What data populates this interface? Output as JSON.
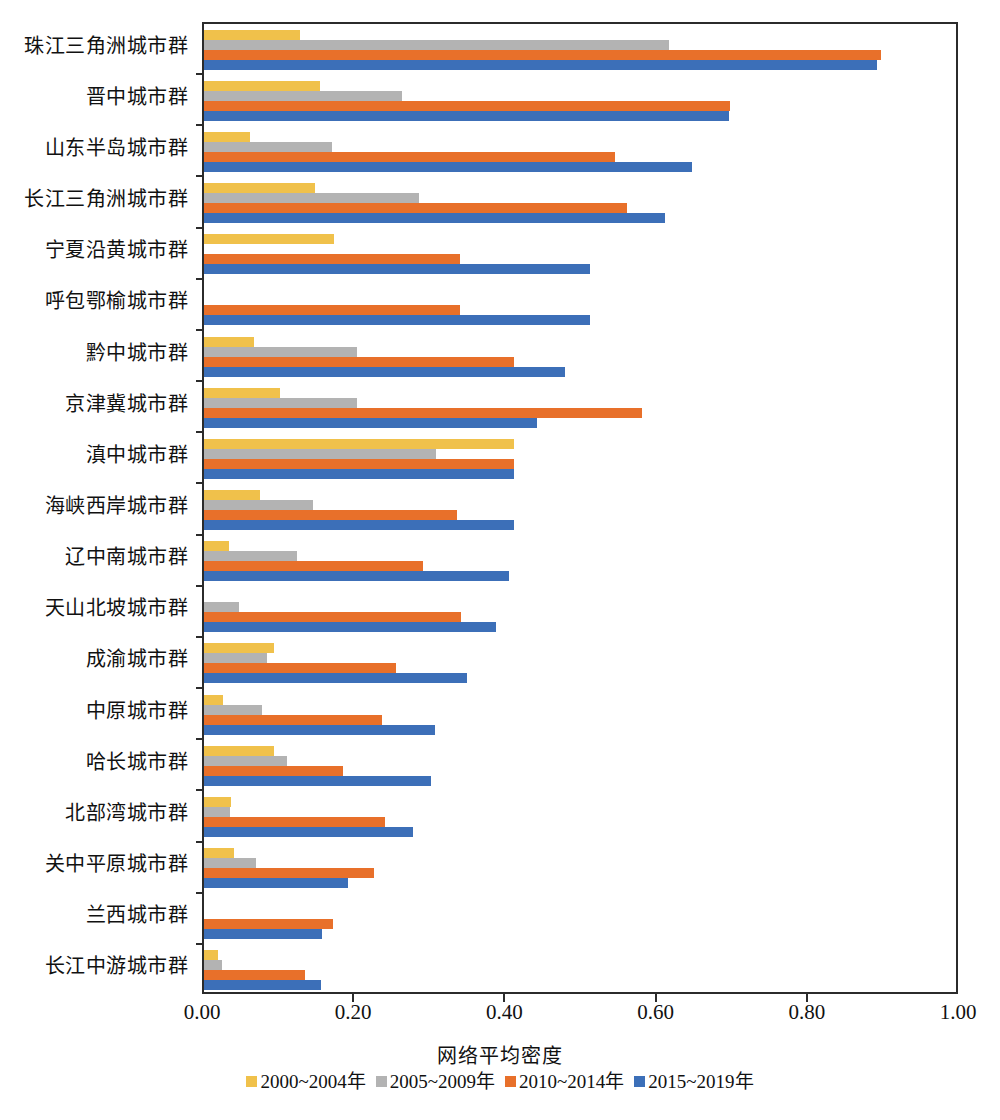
{
  "chart_data": {
    "type": "bar",
    "orientation": "horizontal",
    "title": "",
    "xlabel": "网络平均密度",
    "ylabel": "",
    "xlim": [
      0.0,
      1.0
    ],
    "xticks": [
      "0.00",
      "0.20",
      "0.40",
      "0.60",
      "0.80",
      "1.00"
    ],
    "xtick_values": [
      0.0,
      0.2,
      0.4,
      0.6,
      0.8,
      1.0
    ],
    "grid": false,
    "legend_position": "bottom",
    "categories": [
      "珠江三角洲城市群",
      "晋中城市群",
      "山东半岛城市群",
      "长江三角洲城市群",
      "宁夏沿黄城市群",
      "呼包鄂榆城市群",
      "黔中城市群",
      "京津冀城市群",
      "滇中城市群",
      "海峡西岸城市群",
      "辽中南城市群",
      "天山北坡城市群",
      "成渝城市群",
      "中原城市群",
      "哈长城市群",
      "北部湾城市群",
      "关中平原城市群",
      "兰西城市群",
      "长江中游城市群"
    ],
    "series": [
      {
        "name": "2000~2004年",
        "color": "#f0c14b",
        "values": [
          0.127,
          0.153,
          0.061,
          0.147,
          0.172,
          0.0,
          0.066,
          0.1,
          0.41,
          0.074,
          0.033,
          0.0,
          0.093,
          0.025,
          0.093,
          0.036,
          0.04,
          0.0,
          0.018
        ]
      },
      {
        "name": "2005~2009年",
        "color": "#b3b3b3",
        "values": [
          0.615,
          0.262,
          0.169,
          0.285,
          0.0,
          0.0,
          0.203,
          0.202,
          0.307,
          0.144,
          0.123,
          0.046,
          0.083,
          0.077,
          0.11,
          0.034,
          0.069,
          0.0,
          0.024
        ]
      },
      {
        "name": "2010~2014年",
        "color": "#e8702a",
        "values": [
          0.895,
          0.696,
          0.543,
          0.559,
          0.338,
          0.338,
          0.41,
          0.58,
          0.41,
          0.335,
          0.29,
          0.34,
          0.254,
          0.236,
          0.184,
          0.24,
          0.225,
          0.17,
          0.134
        ]
      },
      {
        "name": "2015~2019年",
        "color": "#3c6fb8",
        "values": [
          0.89,
          0.694,
          0.645,
          0.61,
          0.51,
          0.51,
          0.477,
          0.44,
          0.41,
          0.41,
          0.403,
          0.386,
          0.348,
          0.305,
          0.3,
          0.277,
          0.19,
          0.156,
          0.155
        ]
      }
    ]
  }
}
